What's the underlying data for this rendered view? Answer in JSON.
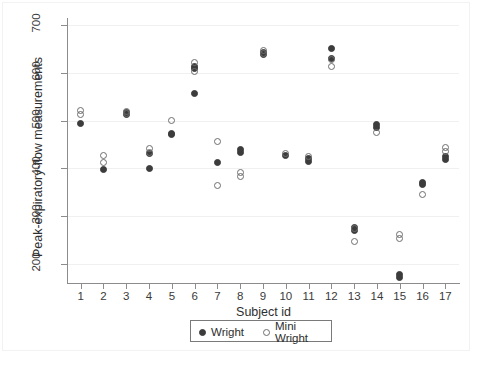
{
  "chart_data": {
    "type": "scatter",
    "title": "",
    "xlabel": "Subject id",
    "ylabel": "Peak-expiratory-flow measurements",
    "xlim": [
      0.4,
      17.6
    ],
    "ylim": [
      160,
      715
    ],
    "xticks": [
      "1",
      "2",
      "3",
      "4",
      "5",
      "6",
      "7",
      "8",
      "9",
      "10",
      "11",
      "12",
      "13",
      "14",
      "15",
      "16",
      "17"
    ],
    "yticks": [
      "200",
      "300",
      "400",
      "500",
      "600",
      "700"
    ],
    "ytick_values": [
      200,
      300,
      400,
      500,
      600,
      700
    ],
    "grid": true,
    "legend_position": "below-axes-center",
    "series": [
      {
        "name": "Wright",
        "marker": "filled-circle",
        "color": "#3c3c3c",
        "points": [
          {
            "x": 1,
            "y": 494
          },
          {
            "x": 2,
            "y": 397
          },
          {
            "x": 3,
            "y": 512
          },
          {
            "x": 3,
            "y": 518
          },
          {
            "x": 4,
            "y": 400
          },
          {
            "x": 4,
            "y": 432
          },
          {
            "x": 5,
            "y": 470
          },
          {
            "x": 5,
            "y": 474
          },
          {
            "x": 6,
            "y": 556
          },
          {
            "x": 6,
            "y": 610
          },
          {
            "x": 6,
            "y": 614
          },
          {
            "x": 7,
            "y": 412
          },
          {
            "x": 8,
            "y": 433
          },
          {
            "x": 8,
            "y": 439
          },
          {
            "x": 9,
            "y": 638
          },
          {
            "x": 9,
            "y": 643
          },
          {
            "x": 10,
            "y": 427
          },
          {
            "x": 11,
            "y": 415
          },
          {
            "x": 11,
            "y": 421
          },
          {
            "x": 12,
            "y": 652
          },
          {
            "x": 12,
            "y": 630
          },
          {
            "x": 13,
            "y": 271
          },
          {
            "x": 13,
            "y": 277
          },
          {
            "x": 14,
            "y": 486
          },
          {
            "x": 14,
            "y": 492
          },
          {
            "x": 15,
            "y": 172
          },
          {
            "x": 15,
            "y": 178
          },
          {
            "x": 16,
            "y": 366
          },
          {
            "x": 16,
            "y": 371
          },
          {
            "x": 17,
            "y": 418
          },
          {
            "x": 17,
            "y": 424
          }
        ]
      },
      {
        "name": "Mini Wright",
        "marker": "open-circle",
        "color": "#6e6e6e",
        "points": [
          {
            "x": 1,
            "y": 512
          },
          {
            "x": 1,
            "y": 522
          },
          {
            "x": 2,
            "y": 412
          },
          {
            "x": 2,
            "y": 428
          },
          {
            "x": 3,
            "y": 514
          },
          {
            "x": 3,
            "y": 520
          },
          {
            "x": 4,
            "y": 434
          },
          {
            "x": 4,
            "y": 441
          },
          {
            "x": 5,
            "y": 501
          },
          {
            "x": 6,
            "y": 604
          },
          {
            "x": 6,
            "y": 622
          },
          {
            "x": 7,
            "y": 364
          },
          {
            "x": 7,
            "y": 456
          },
          {
            "x": 8,
            "y": 384
          },
          {
            "x": 8,
            "y": 391
          },
          {
            "x": 9,
            "y": 640
          },
          {
            "x": 9,
            "y": 647
          },
          {
            "x": 10,
            "y": 432
          },
          {
            "x": 11,
            "y": 424
          },
          {
            "x": 12,
            "y": 613
          },
          {
            "x": 12,
            "y": 628
          },
          {
            "x": 13,
            "y": 247
          },
          {
            "x": 13,
            "y": 274
          },
          {
            "x": 14,
            "y": 476
          },
          {
            "x": 15,
            "y": 254
          },
          {
            "x": 15,
            "y": 261
          },
          {
            "x": 16,
            "y": 346
          },
          {
            "x": 17,
            "y": 436
          },
          {
            "x": 17,
            "y": 443
          }
        ]
      }
    ]
  },
  "legend": {
    "entries": [
      {
        "label": "Wright",
        "marker": "filled-circle"
      },
      {
        "label": "Mini Wright",
        "marker": "open-circle"
      }
    ]
  }
}
